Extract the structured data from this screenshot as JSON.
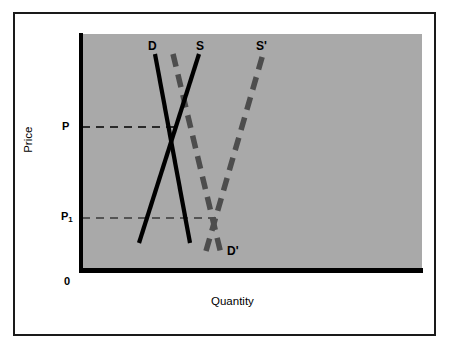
{
  "figure": {
    "background_color": "#ffffff",
    "panel_color": "#a9a9a9",
    "axis_color": "#000000",
    "curve_solid_color": "#000000",
    "curve_dashed_color": "#4d4d4d"
  },
  "axes": {
    "y_title": "Price",
    "x_title": "Quantity",
    "origin_label": "0",
    "y_ticks": [
      {
        "id": "p",
        "label": "P",
        "sub": ""
      },
      {
        "id": "p1",
        "label": "P",
        "sub": "1"
      }
    ]
  },
  "curve_labels": {
    "demand": "D",
    "supply": "S",
    "supply_shifted": "S'",
    "demand_shifted": "D'"
  },
  "chart_data": {
    "type": "line",
    "title": "",
    "subtitle": "",
    "xlabel": "Quantity",
    "ylabel": "Price",
    "xlim": [
      0,
      100
    ],
    "ylim": [
      0,
      100
    ],
    "grid": false,
    "legend_position": "inline-curve-labels",
    "series": [
      {
        "name": "D",
        "label": "D",
        "style": "solid",
        "color": "#000000",
        "width": 4,
        "description": "Original demand curve, downward sloping",
        "points": [
          {
            "x_px": 155,
            "y_px": 54
          },
          {
            "x_px": 190,
            "y_px": 243
          }
        ]
      },
      {
        "name": "S",
        "label": "S",
        "style": "solid",
        "color": "#000000",
        "width": 4,
        "description": "Original supply curve, upward sloping",
        "points": [
          {
            "x_px": 139,
            "y_px": 243
          },
          {
            "x_px": 199,
            "y_px": 54
          }
        ]
      },
      {
        "name": "D'",
        "label": "D'",
        "style": "dashed",
        "color": "#4d4d4d",
        "width": 5,
        "description": "Shifted demand curve, downward sloping, dashed",
        "points": [
          {
            "x_px": 173,
            "y_px": 54
          },
          {
            "x_px": 221,
            "y_px": 254
          }
        ]
      },
      {
        "name": "S'",
        "label": "S'",
        "style": "dashed",
        "color": "#4d4d4d",
        "width": 5,
        "description": "Shifted supply curve, upward sloping, dashed",
        "points": [
          {
            "x_px": 206,
            "y_px": 251
          },
          {
            "x_px": 263,
            "y_px": 54
          }
        ]
      }
    ],
    "annotations": [
      {
        "name": "equilibrium-P",
        "type": "hline",
        "label": "P",
        "style": "dashed",
        "y_px": 127,
        "x_start_px": 82,
        "x_end_px": 173,
        "description": "Original equilibrium price level where D crosses S"
      },
      {
        "name": "equilibrium-P1",
        "type": "hline",
        "label": "P1",
        "style": "dashed",
        "y_px": 218,
        "x_start_px": 82,
        "x_end_px": 216,
        "description": "New lower equilibrium price level where D' crosses S'"
      }
    ],
    "equilibria": [
      {
        "name": "original",
        "price_label": "P",
        "x_px": 173,
        "y_px": 127
      },
      {
        "name": "new",
        "price_label": "P1",
        "x_px": 216,
        "y_px": 218
      }
    ]
  }
}
